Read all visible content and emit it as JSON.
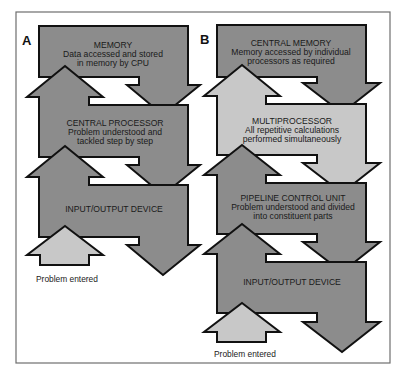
{
  "panels": [
    {
      "label": "A",
      "blocks": [
        {
          "title": "MEMORY",
          "lines": [
            "Data accessed and stored",
            "in memory by CPU"
          ]
        },
        {
          "title": "CENTRAL PROCESSOR",
          "lines": [
            "Problem understood and",
            "tackled step by step"
          ]
        },
        {
          "title": "INPUT/OUTPUT DEVICE",
          "lines": []
        }
      ],
      "caption": "Problem entered"
    },
    {
      "label": "B",
      "blocks": [
        {
          "title": "CENTRAL MEMORY",
          "lines": [
            "Memory accessed by individual",
            "processors as required"
          ]
        },
        {
          "title": "MULTIPROCESSOR",
          "lines": [
            "All repetitive calculations",
            "performed simultaneously"
          ]
        },
        {
          "title": "PIPELINE CONTROL UNIT",
          "lines": [
            "Problem understood and divided",
            "into constituent parts"
          ]
        },
        {
          "title": "INPUT/OUTPUT DEVICE",
          "lines": []
        }
      ],
      "caption": "Problem entered"
    }
  ],
  "colors": {
    "dark_fill": "#8c8c8c",
    "light_fill": "#c8c8c8",
    "outline": "#111111",
    "frame": "#6e6e6e"
  }
}
